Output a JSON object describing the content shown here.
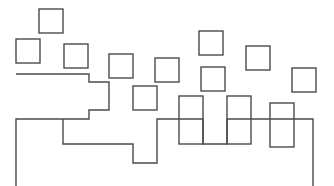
{
  "figure": {
    "width": 334,
    "height": 186,
    "background_color": "#ffffff",
    "stroke_color": "#4a4a4a",
    "stroke_width": 1.4,
    "fill": "none"
  },
  "chart_data": {
    "type": "diagram",
    "title": "",
    "xlabel": "",
    "ylabel": "",
    "grid": false,
    "legend": null,
    "xlim": [
      0,
      334
    ],
    "ylim": [
      0,
      186
    ],
    "squares": [
      {
        "id": "sq-1",
        "x": 39,
        "y": 9,
        "w": 24,
        "h": 24
      },
      {
        "id": "sq-2",
        "x": 16,
        "y": 39,
        "w": 24,
        "h": 24
      },
      {
        "id": "sq-3",
        "x": 64,
        "y": 44,
        "w": 24,
        "h": 24
      },
      {
        "id": "sq-4",
        "x": 109,
        "y": 54,
        "w": 24,
        "h": 24
      },
      {
        "id": "sq-5",
        "x": 155,
        "y": 58,
        "w": 24,
        "h": 24
      },
      {
        "id": "sq-6",
        "x": 133,
        "y": 86,
        "w": 24,
        "h": 24
      },
      {
        "id": "sq-7",
        "x": 199,
        "y": 31,
        "w": 24,
        "h": 24
      },
      {
        "id": "sq-8",
        "x": 201,
        "y": 67,
        "w": 24,
        "h": 24
      },
      {
        "id": "sq-9",
        "x": 246,
        "y": 46,
        "w": 24,
        "h": 24
      },
      {
        "id": "sq-10",
        "x": 292,
        "y": 68,
        "w": 24,
        "h": 24
      },
      {
        "id": "sq-11",
        "x": 179,
        "y": 96,
        "w": 24,
        "h": 48
      },
      {
        "id": "sq-12",
        "x": 227,
        "y": 96,
        "w": 24,
        "h": 48
      },
      {
        "id": "sq-13",
        "x": 270,
        "y": 103,
        "w": 24,
        "h": 44
      }
    ],
    "polyline": {
      "id": "staircase-path",
      "closed": false,
      "points": [
        [
          16,
          74
        ],
        [
          89,
          74
        ],
        [
          89,
          82
        ],
        [
          109,
          82
        ],
        [
          109,
          110
        ],
        [
          89,
          110
        ],
        [
          89,
          119
        ],
        [
          16,
          119
        ],
        [
          16,
          186
        ]
      ]
    },
    "polyline_2": {
      "id": "staircase-path-right",
      "closed": false,
      "points": [
        [
          63,
          119
        ],
        [
          63,
          144
        ],
        [
          133,
          144
        ],
        [
          133,
          163
        ],
        [
          157,
          163
        ],
        [
          157,
          119
        ],
        [
          179,
          119
        ],
        [
          179,
          119
        ],
        [
          203,
          119
        ],
        [
          203,
          144
        ],
        [
          227,
          144
        ],
        [
          227,
          119
        ],
        [
          251,
          119
        ],
        [
          251,
          119
        ],
        [
          294,
          119
        ],
        [
          294,
          119
        ],
        [
          313,
          119
        ],
        [
          313,
          186
        ]
      ]
    },
    "notes": [
      "All shapes are unfilled outlines drawn in a uniform dark gray stroke.",
      "The lower polyline threads through and shares edges with the tall bottom rectangles.",
      "Two vertical segments run off the bottom edge of the frame at x=16 and x=313."
    ]
  }
}
